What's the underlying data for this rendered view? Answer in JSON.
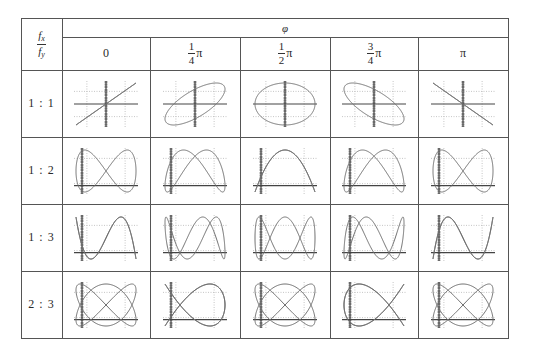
{
  "table": {
    "corner_header": {
      "numerator": "f",
      "numerator_sub": "x",
      "denominator": "f",
      "denominator_sub": "y"
    },
    "group_header": "φ",
    "columns": [
      {
        "label": "0",
        "type": "plain",
        "phase": 0
      },
      {
        "label_num": "1",
        "label_den": "4",
        "label_suffix": "π",
        "type": "frac",
        "phase": 0.25
      },
      {
        "label_num": "1",
        "label_den": "2",
        "label_suffix": "π",
        "type": "frac",
        "phase": 0.5
      },
      {
        "label_num": "3",
        "label_den": "4",
        "label_suffix": "π",
        "type": "frac",
        "phase": 0.75
      },
      {
        "label": "π",
        "type": "plain",
        "phase": 1
      }
    ],
    "rows": [
      {
        "label": "1 : 1",
        "fx": 1,
        "fy": 1
      },
      {
        "label": "1 : 2",
        "fx": 1,
        "fy": 2
      },
      {
        "label": "1 : 3",
        "fx": 1,
        "fy": 3
      },
      {
        "label": "2 : 3",
        "fx": 2,
        "fy": 3
      }
    ]
  },
  "colors": {
    "border": "#555555",
    "curve": "#6e6e6e",
    "axis": "#444444",
    "grid": "#b8b8b8"
  }
}
